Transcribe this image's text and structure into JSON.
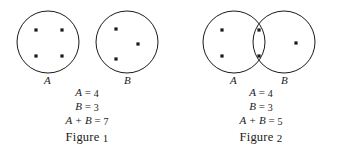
{
  "page": {
    "background_color": "#ffffff",
    "ink_color": "#1a1a1a"
  },
  "figures": [
    {
      "id": "figure-1",
      "caption_text": "Figure",
      "caption_number": "1",
      "description": "Two separate non-overlapping circles representing disjoint sets",
      "sets": [
        {
          "label": "A",
          "count": 4,
          "dots": [
            {
              "x": 36,
              "y": 26
            },
            {
              "x": 62,
              "y": 26
            },
            {
              "x": 36,
              "y": 52
            },
            {
              "x": 62,
              "y": 52
            }
          ],
          "circle": {
            "cx": 48,
            "cy": 38,
            "r": 31
          }
        },
        {
          "label": "B",
          "count": 3,
          "dots": [
            {
              "x": 116,
              "y": 25
            },
            {
              "x": 138,
              "y": 40
            },
            {
              "x": 116,
              "y": 55
            }
          ],
          "circle": {
            "cx": 127,
            "cy": 38,
            "r": 31
          }
        }
      ],
      "equations": [
        {
          "left": "A",
          "op": "=",
          "right": "4"
        },
        {
          "left": "B",
          "op": "=",
          "right": "3"
        },
        {
          "left": "A + B",
          "op": "=",
          "right": "7"
        }
      ],
      "equation_lines": [
        "A = 4",
        "B = 3",
        "A + B = 7"
      ]
    },
    {
      "id": "figure-2",
      "caption_text": "Figure",
      "caption_number": "2",
      "description": "Two overlapping circles; two dots lie in the shared intersection lens",
      "sets": [
        {
          "label": "A",
          "count": 4,
          "circle": {
            "cx": 60,
            "cy": 38,
            "r": 31
          }
        },
        {
          "label": "B",
          "count": 3,
          "circle": {
            "cx": 110,
            "cy": 38,
            "r": 31
          }
        }
      ],
      "dots": [
        {
          "x": 48,
          "y": 26,
          "region": "A-only"
        },
        {
          "x": 48,
          "y": 52,
          "region": "A-only"
        },
        {
          "x": 85,
          "y": 26,
          "region": "intersection"
        },
        {
          "x": 85,
          "y": 52,
          "region": "intersection"
        },
        {
          "x": 122,
          "y": 39,
          "region": "B-only"
        }
      ],
      "union_count": 5,
      "intersection_count": 2,
      "equations": [
        {
          "left": "A",
          "op": "=",
          "right": "4"
        },
        {
          "left": "B",
          "op": "=",
          "right": "3"
        },
        {
          "left": "A + B",
          "op": "=",
          "right": "5"
        }
      ],
      "equation_lines": [
        "A = 4",
        "B = 3",
        "A + B = 5"
      ]
    }
  ]
}
